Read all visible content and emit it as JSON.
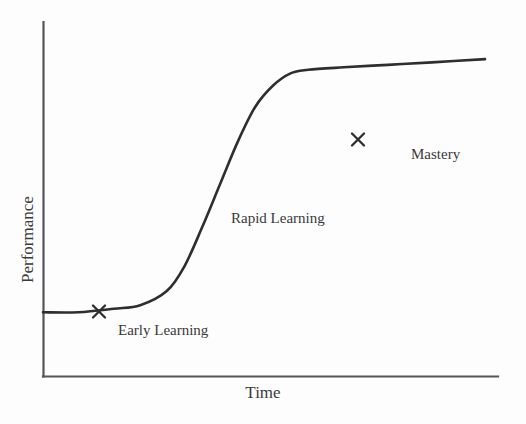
{
  "chart_data": {
    "type": "line",
    "title": "",
    "subtitle": "",
    "xlabel": "Time",
    "ylabel": "Performance",
    "grid": false,
    "legend": null,
    "axes": {
      "x_axis_visible": true,
      "y_axis_visible": true,
      "x_ticks": [],
      "y_ticks": [],
      "xlim": [
        0,
        1
      ],
      "ylim": [
        0,
        1
      ]
    },
    "series": [
      {
        "name": "Learning curve",
        "color": "#2e2e2e",
        "line_width": 2.6,
        "x": [
          0.0,
          0.08,
          0.16,
          0.22,
          0.28,
          0.32,
          0.36,
          0.4,
          0.44,
          0.48,
          0.52,
          0.56,
          0.6,
          0.68,
          0.78,
          0.88,
          1.0
        ],
        "y": [
          0.18,
          0.18,
          0.19,
          0.2,
          0.24,
          0.31,
          0.42,
          0.54,
          0.66,
          0.76,
          0.82,
          0.855,
          0.865,
          0.872,
          0.879,
          0.886,
          0.895
        ]
      }
    ],
    "markers": [
      {
        "name": "early-learning-marker",
        "symbol": "x",
        "x": 0.123,
        "y": 0.184,
        "pixel": [
          99,
          311
        ],
        "color": "#2e2e2e"
      },
      {
        "name": "mastery-marker",
        "symbol": "x",
        "x": 0.692,
        "y": 0.873,
        "pixel": [
          358,
          139
        ],
        "color": "#2e2e2e"
      }
    ],
    "annotations": [
      {
        "name": "early-learning",
        "text": "Early Learning",
        "x": 0.17,
        "y": 0.145
      },
      {
        "name": "rapid-learning",
        "text": "Rapid Learning",
        "x": 0.41,
        "y": 0.44
      },
      {
        "name": "mastery",
        "text": "Mastery",
        "x": 0.81,
        "y": 0.8
      }
    ]
  },
  "figure": {
    "background_color": "#fdfdfd",
    "axis_color": "#55555a",
    "text_color": "#3a3a3a",
    "curve_color": "#2e2e2e"
  },
  "labels": {
    "x_axis": "Time",
    "y_axis": "Performance",
    "early_learning": "Early Learning",
    "rapid_learning": "Rapid Learning",
    "mastery": "Mastery"
  }
}
